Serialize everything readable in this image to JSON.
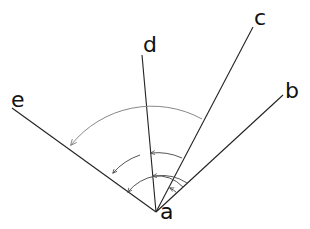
{
  "diagram": {
    "title": "",
    "vertex": {
      "label": "a"
    },
    "rays": [
      {
        "id": "b",
        "label": "b"
      },
      {
        "id": "c",
        "label": "c"
      },
      {
        "id": "d",
        "label": "d"
      },
      {
        "id": "e",
        "label": "e"
      }
    ],
    "angle_arcs": [
      {
        "from": "b",
        "to": "c",
        "description": "angle b-a-c"
      },
      {
        "from": "b",
        "to": "d",
        "description": "angle b-a-d"
      },
      {
        "from": "b",
        "to": "e",
        "description": "angle b-a-e"
      },
      {
        "from": "c",
        "to": "d",
        "description": "angle c-a-d"
      },
      {
        "from": "d",
        "to": "e",
        "description": "angle d-a-e"
      },
      {
        "from": "c",
        "to": "e",
        "description": "angle c-a-e (large)"
      }
    ],
    "colors": {
      "lines": "#222222",
      "arcs": "#555555",
      "big_arc": "#888888"
    }
  }
}
